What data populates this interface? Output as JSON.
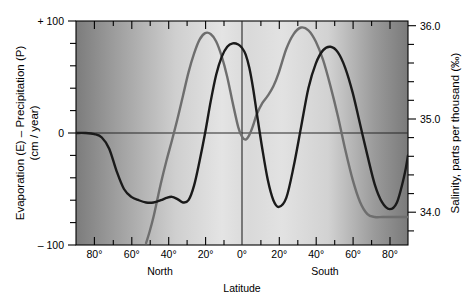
{
  "chart_data": {
    "type": "line",
    "title": "",
    "xlabel": "Latitude",
    "hemisphere_left_label": "North",
    "hemisphere_right_label": "South",
    "ylabel_left": "Evaporation (E) – Precipitation (P)",
    "ylabel_left_units": "(cm / year)",
    "ylabel_right": "Salinity, parts per thousand (‰)",
    "ylim_left": [
      -100,
      100
    ],
    "ylim_right": [
      33.6,
      36.0
    ],
    "xlim": [
      -90,
      90
    ],
    "grid": false,
    "x_ticks_major": [
      -80,
      -60,
      -40,
      -20,
      0,
      20,
      40,
      60,
      80
    ],
    "x_tick_labels": [
      "80°",
      "60°",
      "40°",
      "20°",
      "0°",
      "20°",
      "40°",
      "60°",
      "80°"
    ],
    "x_ticks_minor": [
      -90,
      -70,
      -50,
      -30,
      -10,
      10,
      30,
      50,
      70,
      90
    ],
    "y_left_ticks_major": [
      -100,
      0,
      100
    ],
    "y_left_tick_labels": [
      "– 100",
      "0",
      "+ 100"
    ],
    "y_left_ticks_minor": [
      -80,
      -60,
      -40,
      -20,
      20,
      40,
      60,
      80
    ],
    "y_right_ticks_major": [
      34.0,
      35.0,
      36.0
    ],
    "y_right_tick_labels": [
      "34.0",
      "35.0",
      "36.0"
    ],
    "y_right_ticks_minor": [
      33.8,
      34.2,
      34.4,
      34.6,
      34.8,
      35.2,
      35.4,
      35.6,
      35.8
    ],
    "zero_line_y": 0,
    "equator_line_x": 0,
    "series": [
      {
        "name": "Evaporation minus Precipitation",
        "color": "#1a1a1a",
        "axis": "left",
        "units": "cm / year",
        "x": [
          -90,
          -85,
          -80,
          -76,
          -72,
          -68,
          -64,
          -60,
          -56,
          -52,
          -48,
          -44,
          -41,
          -38,
          -35,
          -32,
          -29,
          -26,
          -23,
          -20,
          -17,
          -14,
          -11,
          -8,
          -5,
          -2,
          0,
          2,
          4,
          6,
          8,
          11,
          14,
          17,
          20,
          24,
          28,
          32,
          36,
          40,
          44,
          48,
          52,
          56,
          60,
          64,
          68,
          72,
          76,
          80,
          84,
          88,
          90
        ],
        "y": [
          0,
          0,
          -1,
          -4,
          -14,
          -34,
          -50,
          -57,
          -60,
          -62,
          -62,
          -60,
          -58,
          -57,
          -59,
          -62,
          -60,
          -47,
          -25,
          0,
          28,
          52,
          68,
          77,
          80,
          79,
          76,
          70,
          58,
          40,
          18,
          -14,
          -42,
          -60,
          -66,
          -58,
          -30,
          5,
          40,
          62,
          74,
          77,
          72,
          58,
          36,
          8,
          -20,
          -46,
          -62,
          -68,
          -62,
          -38,
          -20
        ]
      },
      {
        "name": "Surface salinity",
        "color": "#6e6e6e",
        "axis": "right",
        "units": "parts per thousand",
        "x": [
          -52,
          -50,
          -48,
          -46,
          -44,
          -41,
          -38,
          -35,
          -32,
          -29,
          -26,
          -23,
          -20,
          -17,
          -14,
          -11,
          -8,
          -5,
          -2,
          0,
          2,
          4,
          6,
          8,
          11,
          14,
          17,
          20,
          24,
          28,
          32,
          36,
          40,
          44,
          48,
          52,
          56,
          60,
          64,
          68,
          72,
          76,
          80,
          84,
          88,
          90
        ],
        "y": [
          33.62,
          33.75,
          33.9,
          34.08,
          34.26,
          34.5,
          34.72,
          34.95,
          35.2,
          35.45,
          35.65,
          35.8,
          35.87,
          35.86,
          35.78,
          35.62,
          35.4,
          35.12,
          34.86,
          34.76,
          34.73,
          34.78,
          34.88,
          35.0,
          35.12,
          35.2,
          35.3,
          35.45,
          35.7,
          35.86,
          35.93,
          35.9,
          35.78,
          35.58,
          35.3,
          34.98,
          34.62,
          34.3,
          34.06,
          33.93,
          33.9,
          33.9,
          33.9,
          33.9,
          33.9,
          33.9
        ]
      }
    ],
    "plot_background": "gradient-gray",
    "background_stops": [
      {
        "pos": 0.0,
        "color": "#7c7c7c"
      },
      {
        "pos": 0.12,
        "color": "#9e9e9e"
      },
      {
        "pos": 0.3,
        "color": "#cfcfcf"
      },
      {
        "pos": 0.44,
        "color": "#e4e4e4"
      },
      {
        "pos": 0.52,
        "color": "#d8d8d8"
      },
      {
        "pos": 0.62,
        "color": "#e2e2e2"
      },
      {
        "pos": 0.76,
        "color": "#d2d2d2"
      },
      {
        "pos": 0.9,
        "color": "#9a9a9a"
      },
      {
        "pos": 1.0,
        "color": "#7a7a7a"
      }
    ],
    "colors": {
      "axis": "#000000",
      "curve_ep": "#1a1a1a",
      "curve_salinity": "#6e6e6e",
      "zero_line": "#2a2a2a"
    }
  }
}
